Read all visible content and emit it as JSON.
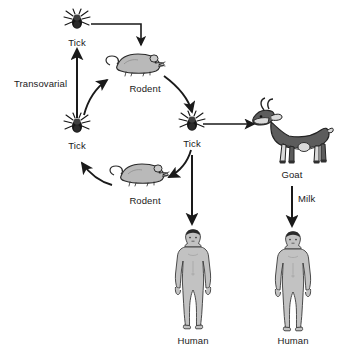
{
  "diagram": {
    "background": "#ffffff",
    "stroke_color": "#1a1a1a",
    "text_color": "#1a1a1a"
  },
  "labels": {
    "tick_top": "Tick",
    "tick_left": "Tick",
    "tick_right": "Tick",
    "rodent_top": "Rodent",
    "rodent_bottom": "Rodent",
    "goat": "Goat",
    "human_left": "Human",
    "human_right": "Human",
    "transovarial": "Transovarial",
    "milk": "Milk"
  },
  "icons": {
    "tick_top": "tick-icon",
    "tick_left": "tick-icon",
    "tick_right": "tick-icon",
    "rodent_top": "rodent-icon",
    "rodent_bottom": "rodent-icon",
    "goat": "goat-icon",
    "human_left": "human-icon",
    "human_right": "human-icon"
  },
  "colors": {
    "tick_body": "#161616",
    "tick_shield": "#4a4a4a",
    "rodent_fill": "#b9b9b9",
    "rodent_outline": "#2b2b2b",
    "goat_dark": "#5c5c5c",
    "goat_light": "#d9d9d9",
    "goat_outline": "#222222",
    "human_fill": "#c2c2c2",
    "human_outline": "#3a3a3a",
    "hair": "#2a2a2a",
    "arrow": "#1a1a1a"
  },
  "edges": [
    {
      "from": "tick_top",
      "to": "rodent_top",
      "style": "elbow",
      "label": ""
    },
    {
      "from": "rodent_top",
      "to": "tick_right",
      "style": "curve",
      "label": ""
    },
    {
      "from": "tick_right",
      "to": "rodent_bottom",
      "style": "curve",
      "label": ""
    },
    {
      "from": "rodent_bottom",
      "to": "tick_left",
      "style": "curve",
      "label": ""
    },
    {
      "from": "tick_left",
      "to": "rodent_top",
      "style": "curve",
      "label": ""
    },
    {
      "from": "tick_left",
      "to": "tick_top",
      "style": "straight",
      "label": "Transovarial"
    },
    {
      "from": "tick_right",
      "to": "goat",
      "style": "straight",
      "label": ""
    },
    {
      "from": "tick_right",
      "to": "human_left",
      "style": "straight",
      "label": ""
    },
    {
      "from": "goat",
      "to": "human_right",
      "style": "straight",
      "label": "Milk"
    }
  ]
}
